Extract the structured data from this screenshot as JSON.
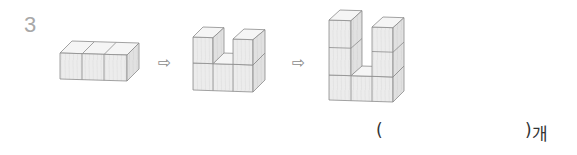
{
  "question": {
    "number": "3",
    "arrow_symbol": "⇨",
    "figures": [
      {
        "name": "figure-1",
        "description": "3 cubes in a row",
        "cube_count": 3
      },
      {
        "name": "figure-2",
        "description": "U-shape, 2 layers high",
        "cube_count": 5
      },
      {
        "name": "figure-3",
        "description": "U-shape, 3 layers high",
        "cube_count": 7
      }
    ],
    "answer": {
      "open_paren": "(",
      "close_paren": ")",
      "unit": "개",
      "value": ""
    }
  },
  "colors": {
    "number": "#a8a8a8",
    "cube_front": "#ececec",
    "cube_top": "#f5f5f5",
    "cube_side": "#dedede",
    "cube_edge": "#8c8c8c"
  }
}
